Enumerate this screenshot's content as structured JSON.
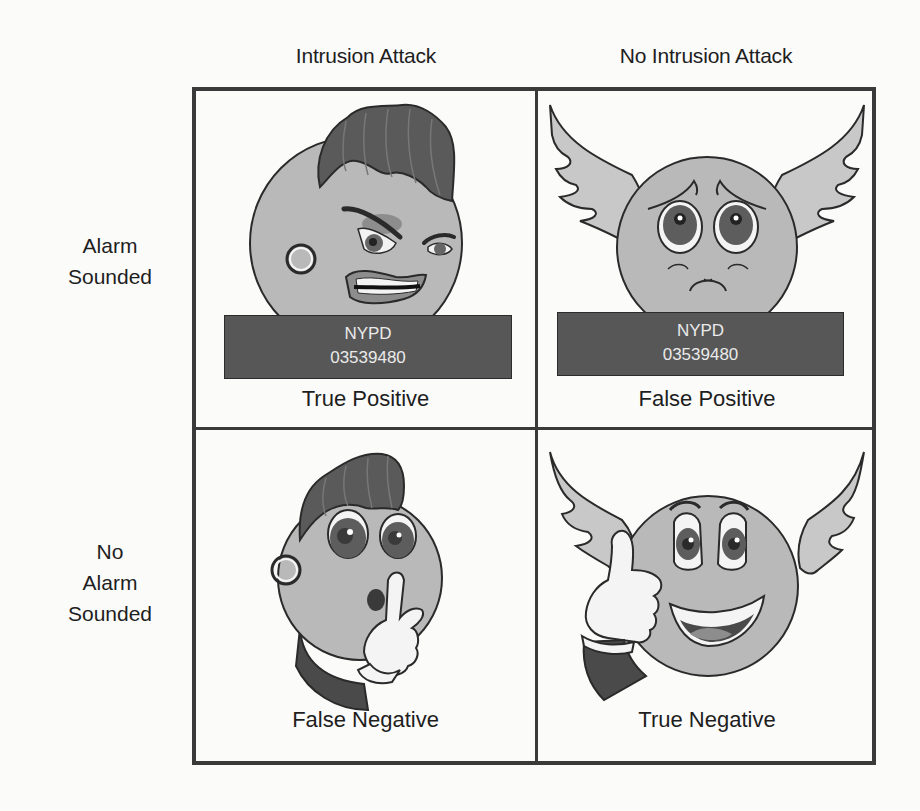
{
  "figure": {
    "columns": [
      {
        "label": "Intrusion Attack"
      },
      {
        "label": "No Intrusion Attack"
      }
    ],
    "rows": [
      {
        "label_line1": "Alarm",
        "label_line2": "Sounded"
      },
      {
        "label_line0": "No",
        "label_line1": "Alarm",
        "label_line2": "Sounded"
      }
    ],
    "cells": [
      {
        "label": "True Positive",
        "character": "angry-intruder-icon",
        "placard": {
          "line1": "NYPD",
          "line2": "03539480"
        }
      },
      {
        "label": "False Positive",
        "character": "sad-angel-icon",
        "placard": {
          "line1": "NYPD",
          "line2": "03539480"
        }
      },
      {
        "label": "False Negative",
        "character": "shushing-intruder-icon"
      },
      {
        "label": "True Negative",
        "character": "happy-angel-thumbs-up-icon"
      }
    ],
    "colors": {
      "border": "#3a3a3a",
      "face": "#b9b9b9",
      "hair": "#5a5a5a",
      "placard": "#575757",
      "placard_text": "#eaeaea",
      "background": "#fbfbfa"
    }
  }
}
